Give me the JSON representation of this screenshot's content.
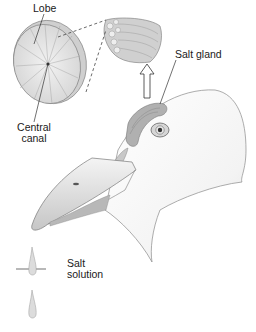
{
  "diagram": {
    "labels": {
      "lobe": "Lobe",
      "central_canal_line1": "Central",
      "central_canal_line2": "canal",
      "salt_gland": "Salt gland",
      "salt_solution_line1": "Salt",
      "salt_solution_line2": "solution"
    },
    "parts": [
      "lobe-cross-section",
      "gland-bundle-cutaway",
      "salt-gland",
      "bird-head",
      "eye",
      "beak",
      "salt-droplets"
    ],
    "colors": {
      "line": "#555555",
      "shade": "#bdbdbd",
      "light": "#e6e6e6",
      "gland": "#a8a8a8"
    }
  }
}
